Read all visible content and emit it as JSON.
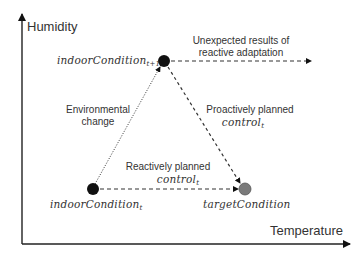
{
  "axes": {
    "y_label": "Humidity",
    "x_label": "Temperature"
  },
  "nodes": {
    "indoor_next": {
      "base": "indoorCondition",
      "subscript": "t+1",
      "color": "#111111"
    },
    "indoor_now": {
      "base": "indoorCondition",
      "subscript": "t",
      "color": "#111111"
    },
    "target": {
      "base": "targetCondition",
      "color": "#7a7a7a"
    }
  },
  "edges": {
    "environmental_change": {
      "line1": "Environmental",
      "line2": "change",
      "style": "dotted"
    },
    "proactive": {
      "line1": "Proactively planned",
      "math_base": "control",
      "math_sub": "t",
      "style": "dashed"
    },
    "reactive": {
      "line1": "Reactively planned",
      "math_base": "control",
      "math_sub": "t",
      "style": "dashed"
    },
    "unexpected": {
      "line1": "Unexpected results of",
      "line2": "reactive adaptation",
      "style": "dashed"
    }
  }
}
